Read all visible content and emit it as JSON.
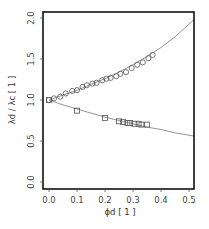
{
  "chart_data": {
    "type": "scatter",
    "title": "",
    "xlabel": "ϕd [ 1 ]",
    "ylabel": "λd / λc   [ 1 ]",
    "xlim": [
      -0.02,
      0.52
    ],
    "ylim": [
      -0.05,
      2.05
    ],
    "xticks": [
      0.0,
      0.1,
      0.2,
      0.3,
      0.4,
      0.5
    ],
    "xtick_labels": [
      "0.0",
      "0.1",
      "0.2",
      "0.3",
      "0.4",
      "0.5"
    ],
    "yticks": [
      0.0,
      0.5,
      1.0,
      1.5,
      2.0
    ],
    "ytick_labels": [
      "0.0",
      "0.5",
      "1.0",
      "1.5",
      "2.0"
    ],
    "grid": false,
    "legend": null,
    "series": [
      {
        "name": "circles",
        "marker": "circle",
        "x": [
          0.0,
          0.018,
          0.04,
          0.06,
          0.083,
          0.1,
          0.12,
          0.135,
          0.155,
          0.17,
          0.19,
          0.205,
          0.22,
          0.24,
          0.255,
          0.275,
          0.295,
          0.315,
          0.335,
          0.355,
          0.37
        ],
        "y": [
          1.0,
          1.02,
          1.04,
          1.08,
          1.11,
          1.12,
          1.16,
          1.18,
          1.2,
          1.21,
          1.24,
          1.26,
          1.27,
          1.29,
          1.32,
          1.34,
          1.39,
          1.43,
          1.46,
          1.51,
          1.55
        ]
      },
      {
        "name": "squares",
        "marker": "square",
        "x": [
          0.0,
          0.1,
          0.2,
          0.25,
          0.265,
          0.28,
          0.29,
          0.305,
          0.32,
          0.33,
          0.35
        ],
        "y": [
          1.0,
          0.87,
          0.78,
          0.74,
          0.73,
          0.72,
          0.72,
          0.71,
          0.71,
          0.7,
          0.7
        ]
      },
      {
        "name": "upper fit curve",
        "marker": "line",
        "x": [
          0.0,
          0.05,
          0.1,
          0.15,
          0.2,
          0.25,
          0.3,
          0.35,
          0.4,
          0.45,
          0.518
        ],
        "y": [
          1.0,
          1.06,
          1.12,
          1.19,
          1.26,
          1.34,
          1.43,
          1.53,
          1.64,
          1.77,
          1.98
        ]
      },
      {
        "name": "lower fit curve",
        "marker": "line",
        "x": [
          0.0,
          0.05,
          0.1,
          0.15,
          0.2,
          0.25,
          0.3,
          0.35,
          0.4,
          0.45,
          0.518
        ],
        "y": [
          1.0,
          0.94,
          0.89,
          0.84,
          0.79,
          0.75,
          0.71,
          0.67,
          0.64,
          0.6,
          0.56
        ]
      }
    ]
  },
  "colors": {
    "frame": "#111111",
    "curve": "#888888",
    "marker": "#555555",
    "text": "#444444"
  }
}
